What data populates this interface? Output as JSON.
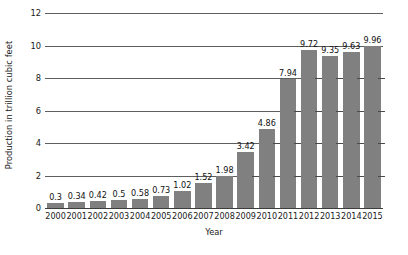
{
  "chart_data": {
    "type": "bar",
    "title": "",
    "xlabel": "Year",
    "ylabel": "Production in trillion cubic feet",
    "categories": [
      "2000",
      "2001",
      "2002",
      "2003",
      "2004",
      "2005",
      "2006",
      "2007",
      "2008",
      "2009",
      "2010",
      "2011",
      "2012",
      "2013",
      "2014",
      "2015"
    ],
    "values": [
      0.3,
      0.34,
      0.42,
      0.5,
      0.58,
      0.73,
      1.02,
      1.52,
      1.98,
      3.42,
      4.86,
      7.94,
      9.72,
      9.35,
      9.63,
      9.96
    ],
    "value_labels": [
      "0.3",
      "0.34",
      "0.42",
      "0.5",
      "0.58",
      "0.73",
      "1.02",
      "1.52",
      "1.98",
      "3.42",
      "4.86",
      "7.94",
      "9.72",
      "9.35",
      "9.63",
      "9.96"
    ],
    "ylim": [
      0,
      12
    ],
    "yticks": [
      0,
      2,
      4,
      6,
      8,
      10,
      12
    ],
    "ytick_labels": [
      "0",
      "2",
      "4",
      "6",
      "8",
      "10",
      "12"
    ],
    "grid": true,
    "legend": "none",
    "bar_color": "#808080",
    "grid_color": "#5e5e5e",
    "axis_color": "#3d3d3d",
    "text_color": "#1a1a1a"
  }
}
